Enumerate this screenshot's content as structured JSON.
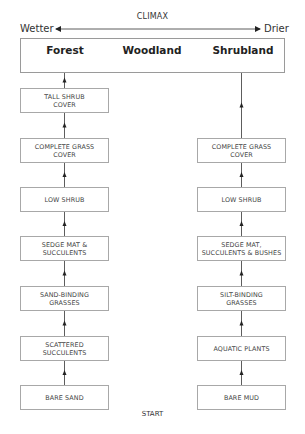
{
  "diagram": {
    "title": "CLIMAX",
    "gradient": {
      "left_label": "Wetter",
      "right_label": "Drier"
    },
    "climax_types": [
      "Forest",
      "Woodland",
      "Shrubland"
    ],
    "start_label": "START",
    "sand_sequence": {
      "stages_bottom_to_top": [
        "BARE SAND",
        "SCATTERED\nSUCCULENTS",
        "SAND-BINDING\nGRASSES",
        "SEDGE MAT &\nSUCCULENTS",
        "LOW SHRUB",
        "COMPLETE GRASS\nCOVER",
        "TALL SHRUB\nCOVER"
      ],
      "leads_to": "Forest"
    },
    "mud_sequence": {
      "stages_bottom_to_top": [
        "BARE MUD",
        "AQUATIC PLANTS",
        "SILT-BINDING\nGRASSES",
        "SEDGE MAT,\nSUCCULENTS & BUSHES",
        "LOW SHRUB",
        "COMPLETE GRASS\nCOVER"
      ],
      "leads_to": "Shrubland"
    }
  }
}
